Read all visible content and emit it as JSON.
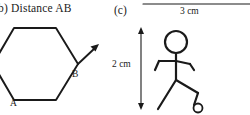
{
  "figure": {
    "background_color": "#ffffff",
    "ink_color": "#1a1a1a",
    "width": 250,
    "height": 115
  },
  "part_b": {
    "heading": "b)  Distance AB",
    "shape_name": "hexagon",
    "vertex_labels": {
      "start": "A",
      "end": "B"
    },
    "arrow_from_vertex": "B",
    "arrow_direction": "up-right"
  },
  "part_c": {
    "heading": "(c)",
    "subject": "stick-figure-person",
    "dimensions": [
      {
        "name": "width",
        "label": "3 cm",
        "orientation": "horizontal",
        "position": "top"
      },
      {
        "name": "height",
        "label": "2 cm",
        "orientation": "vertical",
        "position": "left"
      }
    ]
  }
}
